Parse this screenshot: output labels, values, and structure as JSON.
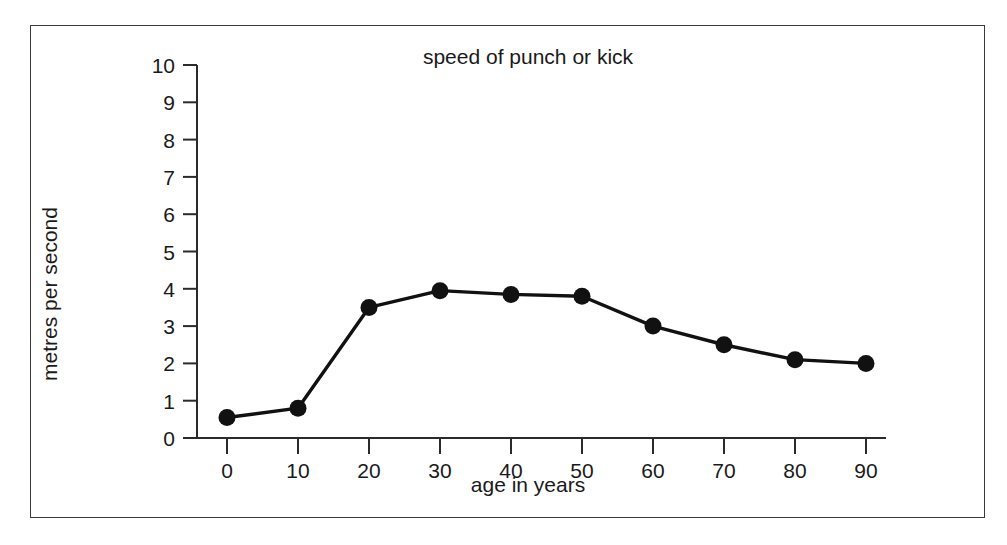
{
  "chart_data": {
    "type": "line",
    "title": "speed of punch or kick",
    "xlabel": "age in years",
    "ylabel": "metres per second",
    "x": [
      0,
      10,
      20,
      30,
      40,
      50,
      60,
      70,
      80,
      90
    ],
    "values": [
      0.55,
      0.8,
      3.5,
      3.95,
      3.85,
      3.8,
      3.0,
      2.5,
      2.1,
      2.0
    ],
    "series": [
      {
        "name": "speed of punch or kick",
        "values": [
          0.55,
          0.8,
          3.5,
          3.95,
          3.85,
          3.8,
          3.0,
          2.5,
          2.1,
          2.0
        ]
      }
    ],
    "xlim": [
      0,
      90
    ],
    "ylim": [
      0,
      10
    ],
    "xticks": [
      0,
      10,
      20,
      30,
      40,
      50,
      60,
      70,
      80,
      90
    ],
    "yticks": [
      0,
      1,
      2,
      3,
      4,
      5,
      6,
      7,
      8,
      9,
      10
    ],
    "xtick_labels": [
      "0",
      "10",
      "20",
      "30",
      "40",
      "50",
      "60",
      "70",
      "80",
      "90"
    ],
    "ytick_labels": [
      "0",
      "1",
      "2",
      "3",
      "4",
      "5",
      "6",
      "7",
      "8",
      "9",
      "10"
    ],
    "grid": false,
    "legend": false,
    "marker": "filled-circle",
    "line_color": "#111111",
    "marker_color": "#111111",
    "background_color": "#ffffff",
    "border_color": "#3a3a3a"
  }
}
